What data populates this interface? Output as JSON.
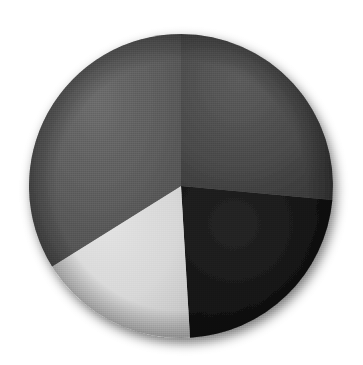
{
  "page": {
    "background_color": "#ffffff",
    "width": 363,
    "height": 365
  },
  "chart_data": {
    "type": "pie",
    "title": "",
    "subtitle": "",
    "xlabel": "",
    "ylabel": "",
    "grid": false,
    "legend": "none",
    "labels_shown": false,
    "start_angle_deg": 0,
    "direction": "clockwise",
    "center": {
      "x": 181,
      "y": 186
    },
    "radius": 152,
    "categories": [
      "Segment 1",
      "Segment 2",
      "Segment 3",
      "Segment 4"
    ],
    "values": [
      26.5,
      22.6,
      17.1,
      33.8
    ],
    "percentages": [
      "26.5%",
      "22.6%",
      "17.1%",
      "33.8%"
    ],
    "angles_deg": [
      95.3,
      81.3,
      61.4,
      122.0
    ],
    "boundaries_deg": [
      0,
      95.3,
      176.6,
      238.0,
      360
    ],
    "colors": [
      "#4a4a4a",
      "#141414",
      "#d6d6d6",
      "#5a5a5a"
    ],
    "slices": [
      {
        "name": "Segment 1",
        "position": "top-right",
        "value": 26.5,
        "percent": "26.5%",
        "color": "#4a4a4a",
        "start_deg": 0,
        "end_deg": 95.3
      },
      {
        "name": "Segment 2",
        "position": "bottom-right",
        "value": 22.6,
        "percent": "22.6%",
        "color": "#141414",
        "start_deg": 95.3,
        "end_deg": 176.6
      },
      {
        "name": "Segment 3",
        "position": "bottom-left",
        "value": 17.1,
        "percent": "17.1%",
        "color": "#d6d6d6",
        "start_deg": 176.6,
        "end_deg": 238.0
      },
      {
        "name": "Segment 4",
        "position": "top-left",
        "value": 33.8,
        "percent": "33.8%",
        "color": "#5a5a5a",
        "start_deg": 238.0,
        "end_deg": 360.0
      }
    ]
  },
  "style": {
    "has_drop_shadow": true,
    "shadow_color": "#b9b9b9",
    "rendering": "grayscale-halftone-texture"
  }
}
